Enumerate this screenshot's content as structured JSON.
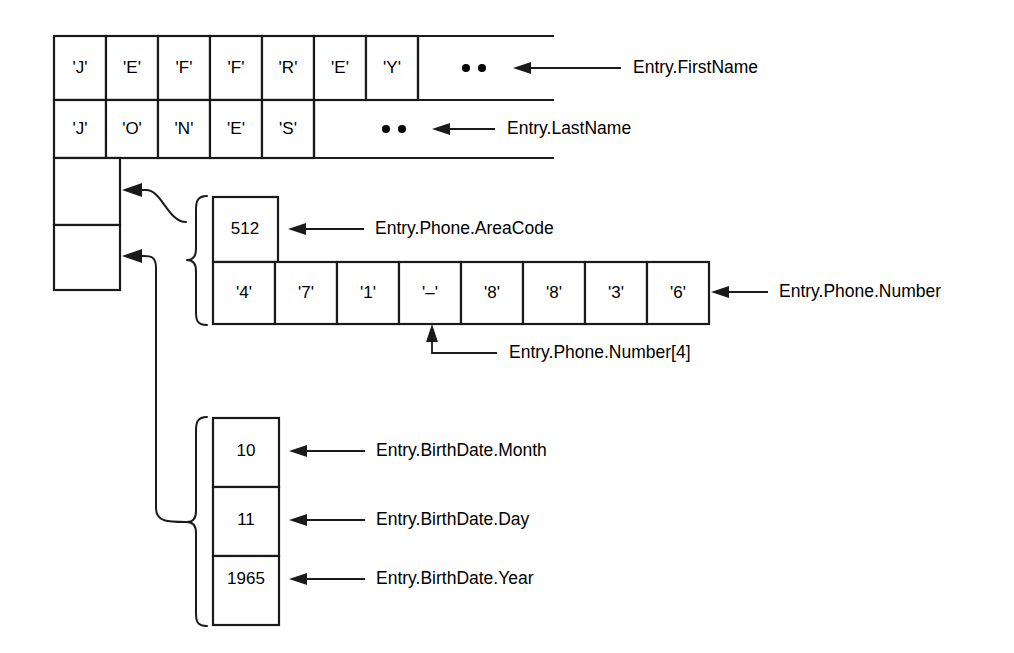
{
  "diagram": {
    "stroke_color": "#1a1a1a",
    "background_color": "#ffffff"
  },
  "first_name": {
    "label": "Entry.FirstName",
    "cells": [
      "'J'",
      "'E'",
      "'F'",
      "'F'",
      "'R'",
      "'E'",
      "'Y'"
    ],
    "terminator": "••"
  },
  "last_name": {
    "label": "Entry.LastName",
    "cells": [
      "'J'",
      "'O'",
      "'N'",
      "'E'",
      "'S'"
    ],
    "terminator": "••"
  },
  "pointer_slots": {
    "phone_slot": "",
    "birthdate_slot": ""
  },
  "phone": {
    "area_code": {
      "label": "Entry.Phone.AreaCode",
      "value": "512"
    },
    "number": {
      "label": "Entry.Phone.Number",
      "cells": [
        "'4'",
        "'7'",
        "'1'",
        "'–'",
        "'8'",
        "'8'",
        "'3'",
        "'6'"
      ]
    },
    "index_callout": {
      "label": "Entry.Phone.Number[4]",
      "points_to_index": 3
    }
  },
  "birth_date": {
    "month": {
      "label": "Entry.BirthDate.Month",
      "value": "10"
    },
    "day": {
      "label": "Entry.BirthDate.Day",
      "value": "11"
    },
    "year": {
      "label": "Entry.BirthDate.Year",
      "value": "1965"
    }
  }
}
